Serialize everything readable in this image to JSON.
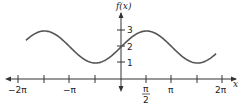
{
  "chart_data": {
    "type": "line",
    "title": "",
    "function": "f(x) = 2 + sin(x)",
    "xlabel": "x",
    "ylabel": "f(x)",
    "xlim": [
      -6.6,
      6.6
    ],
    "ylim": [
      -0.5,
      4.2
    ],
    "x_ticks": [
      {
        "value": -6.2832,
        "label": "−2π"
      },
      {
        "value": -4.7124,
        "label": ""
      },
      {
        "value": -3.1416,
        "label": "−π"
      },
      {
        "value": -1.5708,
        "label": ""
      },
      {
        "value": 1.5708,
        "label": "π/2"
      },
      {
        "value": 3.1416,
        "label": "π"
      },
      {
        "value": 4.7124,
        "label": ""
      },
      {
        "value": 6.2832,
        "label": "2π"
      }
    ],
    "y_ticks": [
      {
        "value": 1,
        "label": "1"
      },
      {
        "value": 2,
        "label": "2"
      },
      {
        "value": 3,
        "label": "3"
      }
    ],
    "x_range_plotted": [
      -5.85,
      5.85
    ],
    "series": [
      {
        "name": "f(x)",
        "color": "#555555",
        "x": [
          -5.85,
          -4.71,
          -3.14,
          -1.57,
          0,
          1.57,
          3.14,
          4.71,
          5.85
        ],
        "y": [
          2.42,
          3,
          2,
          1,
          2,
          3,
          2,
          1,
          1.58
        ]
      }
    ],
    "grid": false,
    "legend": "none"
  },
  "labels": {
    "y_axis": "f(x)",
    "x_axis": "x",
    "x_neg2pi": "−2π",
    "x_negpi": "−π",
    "x_pi": "π",
    "x_2pi": "2π",
    "x_pi_half_num": "π",
    "x_pi_half_den": "2",
    "y1": "1",
    "y2": "2",
    "y3": "3"
  }
}
